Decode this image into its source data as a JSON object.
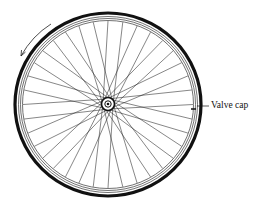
{
  "diagram": {
    "labels": {
      "valve_cap": "Valve cap"
    },
    "annotations": {
      "rotation_arrow": "counter-clockwise rotation arrow"
    },
    "spoke_count": 36,
    "colors": {
      "line": "#111111",
      "background": "#ffffff"
    }
  }
}
